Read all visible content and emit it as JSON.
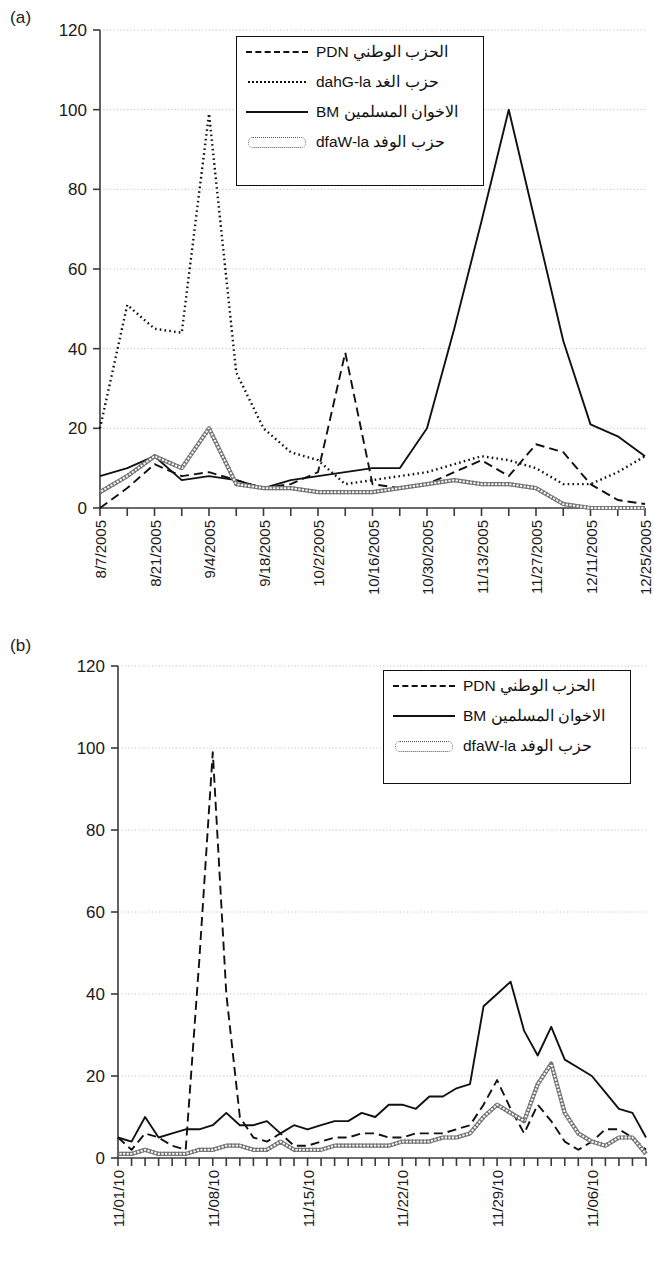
{
  "figure": {
    "panels": [
      {
        "id": "a",
        "label": "(a)"
      },
      {
        "id": "b",
        "label": "(b)"
      }
    ]
  },
  "chart_data": [
    {
      "panel": "(a)",
      "type": "line",
      "title": "",
      "xlabel": "",
      "ylabel": "",
      "ylim": [
        0,
        120
      ],
      "yticks": [
        0,
        20,
        40,
        60,
        80,
        100,
        120
      ],
      "grid": true,
      "legend_position": "top-center-inside",
      "xtick_labels": [
        "8/7/2005",
        "8/21/2005",
        "9/4/2005",
        "9/18/2005",
        "10/2/2005",
        "10/16/2005",
        "10/30/2005",
        "11/13/2005",
        "11/27/2005",
        "12/11/2005",
        "12/25/2005"
      ],
      "x": [
        "8/7/2005",
        "8/14/2005",
        "8/21/2005",
        "8/28/2005",
        "9/4/2005",
        "9/11/2005",
        "9/18/2005",
        "9/25/2005",
        "10/2/2005",
        "10/9/2005",
        "10/16/2005",
        "10/23/2005",
        "10/30/2005",
        "11/6/2005",
        "11/13/2005",
        "11/20/2005",
        "11/27/2005",
        "12/4/2005",
        "12/11/2005",
        "12/18/2005",
        "12/25/2005"
      ],
      "series": [
        {
          "name": "NDP",
          "name_ar": "الحزب الوطني",
          "style": "dashed",
          "values": [
            0,
            5,
            11,
            8,
            9,
            7,
            5,
            6,
            9,
            39,
            6,
            5,
            6,
            9,
            12,
            8,
            16,
            14,
            6,
            2,
            1
          ]
        },
        {
          "name": "al-Ghad",
          "name_ar": "حزب الغد",
          "style": "dotted",
          "values": [
            20,
            51,
            45,
            44,
            99,
            34,
            20,
            14,
            12,
            6,
            7,
            8,
            9,
            11,
            13,
            12,
            10,
            6,
            6,
            9,
            13
          ]
        },
        {
          "name": "MB",
          "name_ar": "الاخوان المسلمين",
          "style": "solid",
          "values": [
            8,
            10,
            13,
            7,
            8,
            7,
            5,
            7,
            8,
            9,
            10,
            10,
            20,
            45,
            72,
            100,
            71,
            42,
            21,
            18,
            13
          ]
        },
        {
          "name": "al-Wafd",
          "name_ar": "حزب الوفد",
          "style": "double-dotted",
          "values": [
            4,
            8,
            13,
            10,
            20,
            6,
            5,
            5,
            4,
            4,
            4,
            5,
            6,
            7,
            6,
            6,
            5,
            1,
            0,
            0,
            0
          ]
        }
      ]
    },
    {
      "panel": "(b)",
      "type": "line",
      "title": "",
      "xlabel": "",
      "ylabel": "",
      "ylim": [
        0,
        120
      ],
      "yticks": [
        0,
        20,
        40,
        60,
        80,
        100,
        120
      ],
      "grid": true,
      "legend_position": "top-right-inside",
      "xtick_labels": [
        "11/01/10",
        "11/08/10",
        "11/15/10",
        "11/22/10",
        "11/29/10",
        "11/06/10"
      ],
      "x": [
        "11/01/10",
        "11/02/10",
        "11/03/10",
        "11/04/10",
        "11/05/10",
        "11/06/10",
        "11/07/10",
        "11/08/10",
        "11/09/10",
        "11/10/10",
        "11/11/10",
        "11/12/10",
        "11/13/10",
        "11/14/10",
        "11/15/10",
        "11/16/10",
        "11/17/10",
        "11/18/10",
        "11/19/10",
        "11/20/10",
        "11/21/10",
        "11/22/10",
        "11/23/10",
        "11/24/10",
        "11/25/10",
        "11/26/10",
        "11/27/10",
        "11/28/10",
        "11/29/10",
        "11/30/10",
        "12/01/10",
        "12/02/10",
        "12/03/10",
        "12/04/10",
        "12/05/10",
        "12/06/10",
        "12/07/10",
        "12/08/10",
        "12/09/10",
        "12/10/10"
      ],
      "series": [
        {
          "name": "NDP",
          "name_ar": "الحزب الوطني",
          "style": "dashed",
          "values": [
            5,
            2,
            6,
            5,
            3,
            2,
            48,
            99,
            40,
            10,
            5,
            4,
            6,
            3,
            3,
            4,
            5,
            5,
            6,
            6,
            5,
            5,
            6,
            6,
            6,
            7,
            8,
            13,
            19,
            12,
            6,
            13,
            9,
            4,
            2,
            4,
            7,
            7,
            5,
            2
          ]
        },
        {
          "name": "MB",
          "name_ar": "الاخوان المسلمين",
          "style": "solid",
          "values": [
            5,
            4,
            10,
            5,
            6,
            7,
            7,
            8,
            11,
            8,
            8,
            9,
            6,
            8,
            7,
            8,
            9,
            9,
            11,
            10,
            13,
            13,
            12,
            15,
            15,
            17,
            18,
            37,
            40,
            43,
            31,
            25,
            32,
            24,
            22,
            20,
            16,
            12,
            11,
            5
          ]
        },
        {
          "name": "al-Wafd",
          "name_ar": "حزب الوفد",
          "style": "double-dotted",
          "values": [
            1,
            1,
            2,
            1,
            1,
            1,
            2,
            2,
            3,
            3,
            2,
            2,
            4,
            2,
            2,
            2,
            3,
            3,
            3,
            3,
            3,
            4,
            4,
            4,
            5,
            5,
            6,
            10,
            13,
            11,
            9,
            18,
            23,
            11,
            6,
            4,
            3,
            5,
            5,
            1
          ]
        }
      ]
    }
  ]
}
